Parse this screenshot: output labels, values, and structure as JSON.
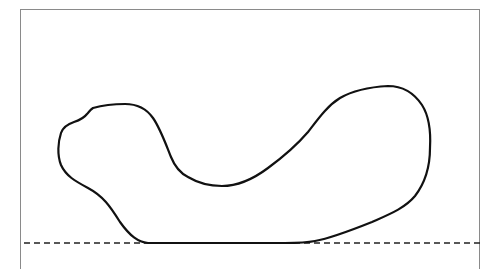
{
  "diagram": {
    "type": "outline-contour",
    "frame": {
      "stroke": "#8a8a8a"
    },
    "shape": {
      "stroke": "#111111",
      "stroke_width": 2.2,
      "path": "M 148 243 C 138 242 130 236 120 222 C 110 206 103 196 88 188 C 75 181 66 176 61 165 C 57 155 58 142 61 133 C 63 127 68 124 74 122 C 80 120 84 118 87 114 C 89 112 90 110 93 108 C 100 106 112 104 125 104 C 136 104 146 108 153 118 C 160 128 165 142 171 157 C 175 167 180 173 188 177 C 198 183 210 186 222 186 C 238 186 252 180 268 168 C 283 157 296 146 308 132 C 318 119 327 106 340 98 C 352 91 370 87 388 86 C 402 86 414 93 422 105 C 429 116 431 130 430 148 C 430 168 425 183 415 196 C 405 208 390 214 372 222 C 352 230 332 238 315 241 C 305 243 295 243 285 243"
    },
    "baseline": {
      "style": "dashed",
      "stroke": "#222222",
      "y": 243,
      "x_start": 24,
      "x_end": 480
    },
    "solid_base_segment": {
      "x_start": 148,
      "x_end": 285,
      "y": 243
    }
  }
}
